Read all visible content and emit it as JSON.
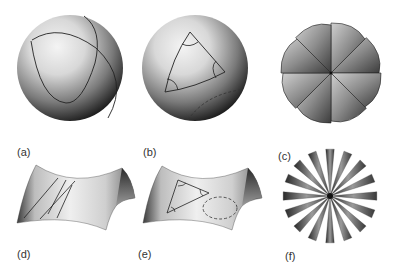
{
  "figure": {
    "panels": [
      {
        "id": "a",
        "label": "(a)",
        "shape": "sphere",
        "feature": "two-great-circles"
      },
      {
        "id": "b",
        "label": "(b)",
        "shape": "sphere",
        "feature": "geodesic-triangle-with-angle-arcs-and-dashed-circle"
      },
      {
        "id": "c",
        "label": "(c)",
        "shape": "flattened-sphere-pinwheel",
        "segments": 8
      },
      {
        "id": "d",
        "label": "(d)",
        "shape": "saddle-surface",
        "feature": "intersecting-geodesic-lines"
      },
      {
        "id": "e",
        "label": "(e)",
        "shape": "saddle-surface",
        "feature": "geodesic-triangle-with-angle-arcs-and-dashed-circle"
      },
      {
        "id": "f",
        "label": "(f)",
        "shape": "flattened-saddle-starburst",
        "segments": 16
      }
    ]
  },
  "colors": {
    "background": "#ffffff",
    "shade_dark": "#1a1a1a",
    "shade_light": "#f2f2f2",
    "line": "#222222"
  }
}
